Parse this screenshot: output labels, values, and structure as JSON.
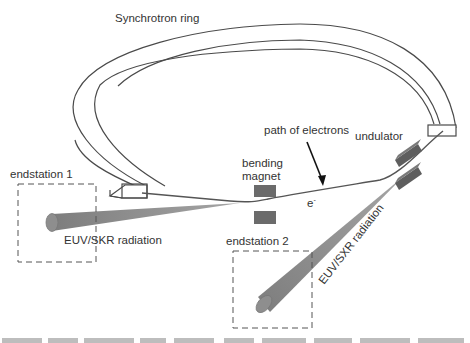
{
  "diagram": {
    "type": "schematic",
    "labels": {
      "ring": "Synchrotron ring",
      "path": "path of electrons",
      "undulator": "undulator",
      "bending_line1": "bending",
      "bending_line2": "magnet",
      "electron": "e",
      "electron_sup": "-",
      "endstation1": "endstation 1",
      "endstation2": "endstation 2",
      "radiation1": "EUV/SKR radiation",
      "radiation2": "EUV/SXR radiation"
    },
    "components": [
      {
        "id": "ring",
        "label": "Synchrotron ring",
        "shape": "open ring segment (box cross-section)"
      },
      {
        "id": "bending-magnet",
        "label": "bending magnet",
        "shape": "pair of dark rectangles"
      },
      {
        "id": "undulator",
        "label": "undulator",
        "shape": "pair of dark bars"
      },
      {
        "id": "endstation-1",
        "label": "endstation 1",
        "shape": "dashed box"
      },
      {
        "id": "endstation-2",
        "label": "endstation 2",
        "shape": "dashed box"
      },
      {
        "id": "beam-1",
        "label": "EUV/SKR radiation",
        "shape": "gray cone"
      },
      {
        "id": "beam-2",
        "label": "EUV/SXR radiation",
        "shape": "gray cone"
      }
    ],
    "colors": {
      "line": "#4a4a4a",
      "magnet": "#666666",
      "beam": "#8c8c8c",
      "text": "#333333",
      "background": "#ffffff"
    }
  }
}
